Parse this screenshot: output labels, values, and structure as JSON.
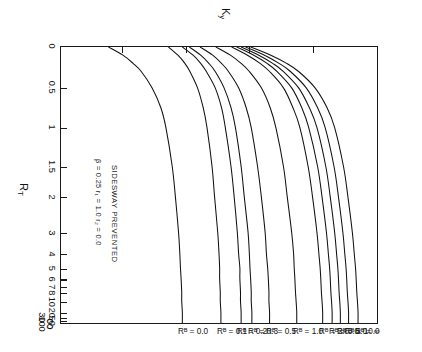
{
  "figure": {
    "kind": "alignment-chart",
    "orientation_note": "printed sideways",
    "axis_titles": {
      "y_main": "K",
      "y_sub": "y",
      "x_main": "R",
      "x_sub": "T"
    },
    "annotations": {
      "condition": "SIDESWAY PREVENTED",
      "parameters": "β = 0.25   r₁ = 1.0   r₂ = 0.0"
    },
    "y_ticks": [
      "0.3",
      "0.4",
      "0.5",
      "0.6",
      "0.7",
      "0.8"
    ],
    "x_ticks": [
      "0",
      "0.5",
      "1",
      "1.5",
      "2",
      "3",
      "4",
      "5",
      "6",
      "7",
      "8",
      "10",
      "20",
      "30",
      "50",
      "100",
      "∞"
    ],
    "curve_labels": [
      "Rᴮ = ∞",
      "Rᴮ = 10.0",
      "Rᴮ = 5.0",
      "Rᴮ = 3.0",
      "Rᴮ = 2.0",
      "Rᴮ = 1.0",
      "Rᴮ = 0.5",
      "Rᴮ = 0.3",
      "Rᴮ = 0.2",
      "Rᴮ = 0.1",
      "Rᴮ = 0.0"
    ]
  },
  "chart_data": {
    "type": "line",
    "title": "",
    "subtitle": "",
    "xlabel": "R_T",
    "ylabel": "K_y",
    "grid": false,
    "legend": "curve-end labels at top of plot",
    "x_scale": "custom compressed (linear 0-2, log-like 2-∞)",
    "xlim": [
      0,
      "∞"
    ],
    "ylim": [
      0.3,
      0.8
    ],
    "x_tick_values": [
      0,
      0.5,
      1,
      1.5,
      2,
      3,
      4,
      5,
      6,
      7,
      8,
      10,
      20,
      30,
      50,
      100,
      "∞"
    ],
    "x_tick_labels": [
      "0",
      "0.5",
      "1",
      "1.5",
      "2",
      "3",
      "4",
      "5",
      "6",
      "7",
      "8",
      "10",
      "20",
      "30",
      "50",
      "100",
      "∞"
    ],
    "y_tick_values": [
      0.3,
      0.4,
      0.5,
      0.6,
      0.7,
      0.8
    ],
    "y_tick_labels": [
      "0.3",
      "0.4",
      "0.5",
      "0.6",
      "0.7",
      "0.8"
    ],
    "annotations": [
      "SIDESWAY PREVENTED",
      "β = 0.25   r₁ = 1.0   r₂ = 0.0"
    ],
    "series": [
      {
        "name": "R_B = ∞",
        "asymptote_Ky": 0.77,
        "start_Ky": 0.6,
        "x": [
          0,
          0.1,
          0.2,
          0.3,
          0.5,
          0.75,
          1,
          1.5,
          2,
          3,
          4,
          5,
          6,
          8,
          10,
          20,
          50,
          100
        ],
        "y": [
          0.6,
          0.632,
          0.657,
          0.676,
          0.702,
          0.721,
          0.733,
          0.747,
          0.754,
          0.761,
          0.764,
          0.766,
          0.767,
          0.768,
          0.769,
          0.77,
          0.77,
          0.77
        ]
      },
      {
        "name": "R_B = 10.0",
        "asymptote_Ky": 0.755,
        "start_Ky": 0.592,
        "x": [
          0,
          0.1,
          0.2,
          0.3,
          0.5,
          0.75,
          1,
          1.5,
          2,
          3,
          4,
          5,
          6,
          8,
          10,
          20,
          50,
          100
        ],
        "y": [
          0.592,
          0.622,
          0.645,
          0.663,
          0.688,
          0.706,
          0.718,
          0.732,
          0.739,
          0.746,
          0.749,
          0.751,
          0.752,
          0.753,
          0.754,
          0.755,
          0.755,
          0.755
        ]
      },
      {
        "name": "R_B = 5.0",
        "asymptote_Ky": 0.742,
        "start_Ky": 0.585,
        "x": [
          0,
          0.1,
          0.2,
          0.3,
          0.5,
          0.75,
          1,
          1.5,
          2,
          3,
          4,
          5,
          6,
          8,
          10,
          20,
          50,
          100
        ],
        "y": [
          0.585,
          0.613,
          0.635,
          0.652,
          0.676,
          0.693,
          0.705,
          0.719,
          0.726,
          0.733,
          0.736,
          0.738,
          0.739,
          0.74,
          0.741,
          0.742,
          0.742,
          0.742
        ]
      },
      {
        "name": "R_B = 3.0",
        "asymptote_Ky": 0.729,
        "start_Ky": 0.578,
        "x": [
          0,
          0.1,
          0.2,
          0.3,
          0.5,
          0.75,
          1,
          1.5,
          2,
          3,
          4,
          5,
          6,
          8,
          10,
          20,
          50,
          100
        ],
        "y": [
          0.578,
          0.605,
          0.626,
          0.642,
          0.665,
          0.681,
          0.692,
          0.706,
          0.713,
          0.72,
          0.723,
          0.725,
          0.726,
          0.727,
          0.728,
          0.729,
          0.729,
          0.729
        ]
      },
      {
        "name": "R_B = 2.0",
        "asymptote_Ky": 0.714,
        "start_Ky": 0.57,
        "x": [
          0,
          0.1,
          0.2,
          0.3,
          0.5,
          0.75,
          1,
          1.5,
          2,
          3,
          4,
          5,
          6,
          8,
          10,
          20,
          50,
          100
        ],
        "y": [
          0.57,
          0.595,
          0.615,
          0.63,
          0.652,
          0.667,
          0.678,
          0.691,
          0.698,
          0.705,
          0.708,
          0.71,
          0.711,
          0.712,
          0.713,
          0.714,
          0.714,
          0.714
        ]
      },
      {
        "name": "R_B = 1.0",
        "asymptote_Ky": 0.673,
        "start_Ky": 0.545,
        "x": [
          0,
          0.1,
          0.2,
          0.3,
          0.5,
          0.75,
          1,
          1.5,
          2,
          3,
          4,
          5,
          6,
          8,
          10,
          20,
          50,
          100
        ],
        "y": [
          0.545,
          0.568,
          0.585,
          0.598,
          0.617,
          0.631,
          0.64,
          0.652,
          0.658,
          0.665,
          0.668,
          0.669,
          0.67,
          0.671,
          0.672,
          0.673,
          0.673,
          0.673
        ]
      },
      {
        "name": "R_B = 0.5",
        "asymptote_Ky": 0.63,
        "start_Ky": 0.52,
        "x": [
          0,
          0.1,
          0.2,
          0.3,
          0.5,
          0.75,
          1,
          1.5,
          2,
          3,
          4,
          5,
          6,
          8,
          10,
          20,
          50,
          100
        ],
        "y": [
          0.52,
          0.54,
          0.554,
          0.565,
          0.581,
          0.593,
          0.601,
          0.611,
          0.617,
          0.623,
          0.625,
          0.627,
          0.628,
          0.629,
          0.629,
          0.63,
          0.63,
          0.63
        ]
      },
      {
        "name": "R_B = 0.3",
        "asymptote_Ky": 0.602,
        "start_Ky": 0.503,
        "x": [
          0,
          0.1,
          0.2,
          0.3,
          0.5,
          0.75,
          1,
          1.5,
          2,
          3,
          4,
          5,
          6,
          8,
          10,
          20,
          50,
          100
        ],
        "y": [
          0.503,
          0.521,
          0.534,
          0.544,
          0.558,
          0.569,
          0.576,
          0.585,
          0.59,
          0.596,
          0.598,
          0.599,
          0.6,
          0.601,
          0.601,
          0.602,
          0.602,
          0.602
        ]
      },
      {
        "name": "R_B = 0.2",
        "asymptote_Ky": 0.585,
        "start_Ky": 0.492,
        "x": [
          0,
          0.1,
          0.2,
          0.3,
          0.5,
          0.75,
          1,
          1.5,
          2,
          3,
          4,
          5,
          6,
          8,
          10,
          20,
          50,
          100
        ],
        "y": [
          0.492,
          0.509,
          0.521,
          0.53,
          0.544,
          0.554,
          0.56,
          0.569,
          0.574,
          0.579,
          0.581,
          0.583,
          0.583,
          0.584,
          0.584,
          0.585,
          0.585,
          0.585
        ]
      },
      {
        "name": "R_B = 0.1",
        "asymptote_Ky": 0.553,
        "start_Ky": 0.47,
        "x": [
          0,
          0.1,
          0.2,
          0.3,
          0.5,
          0.75,
          1,
          1.5,
          2,
          3,
          4,
          5,
          6,
          8,
          10,
          20,
          50,
          100
        ],
        "y": [
          0.47,
          0.485,
          0.496,
          0.504,
          0.516,
          0.525,
          0.531,
          0.539,
          0.543,
          0.548,
          0.55,
          0.551,
          0.551,
          0.552,
          0.552,
          0.553,
          0.553,
          0.553
        ]
      },
      {
        "name": "R_B = 0.0",
        "asymptote_Ky": 0.492,
        "start_Ky": 0.375,
        "x": [
          0,
          0.1,
          0.2,
          0.3,
          0.5,
          0.75,
          1,
          1.5,
          2,
          3,
          4,
          5,
          6,
          8,
          10,
          20,
          50,
          100
        ],
        "y": [
          0.375,
          0.398,
          0.414,
          0.427,
          0.444,
          0.458,
          0.466,
          0.476,
          0.481,
          0.486,
          0.488,
          0.489,
          0.49,
          0.491,
          0.491,
          0.492,
          0.492,
          0.492
        ]
      }
    ]
  }
}
